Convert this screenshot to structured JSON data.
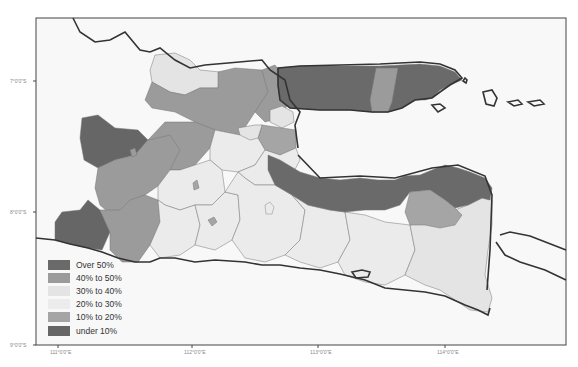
{
  "map": {
    "frame": {
      "x": 36,
      "y": 18,
      "width": 530,
      "height": 327
    },
    "background": "#f7f7f7",
    "sea_color": "#fafafa",
    "coast_color": "#333333",
    "x_ticks": [
      {
        "label": "111°0'0\"E",
        "x": 58
      },
      {
        "label": "112°0'0\"E",
        "x": 192
      },
      {
        "label": "113°0'0\"E",
        "x": 318
      },
      {
        "label": "114°0'0\"E",
        "x": 445
      }
    ],
    "y_ticks": [
      {
        "label": "7°0'0\"S",
        "y": 81
      },
      {
        "label": "8°0'0\"S",
        "y": 212
      },
      {
        "label": "9°0'0\"S",
        "y": 345
      }
    ]
  },
  "legend": {
    "items": [
      {
        "label": "Over 50%",
        "color": "#6a6a6a"
      },
      {
        "label": "40% to 50%",
        "color": "#9b9b9b"
      },
      {
        "label": "30% to 40%",
        "color": "#e4e4e4"
      },
      {
        "label": "20% to 30%",
        "color": "#ececec"
      },
      {
        "label": "10% to 20%",
        "color": "#a5a5a5"
      },
      {
        "label": "under 10%",
        "color": "#666666"
      }
    ]
  },
  "classes": {
    "over50": "#6a6a6a",
    "c40_50": "#9b9b9b",
    "c30_40": "#e2e2e2",
    "c20_30": "#ebebeb",
    "c10_20": "#a5a5a5",
    "under10": "#666666"
  }
}
